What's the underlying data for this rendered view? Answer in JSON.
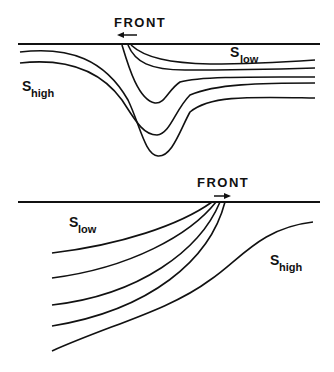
{
  "diagram": {
    "type": "schematic cross-section of salinity fronts",
    "panels": [
      {
        "id": "top",
        "front_label": "FRONT",
        "front_arrow_direction": "left",
        "labels": {
          "low": {
            "base": "S",
            "sub": "low"
          },
          "high": {
            "base": "S",
            "sub": "high"
          }
        },
        "isoline_count": 5
      },
      {
        "id": "bottom",
        "front_label": "FRONT",
        "front_arrow_direction": "right",
        "labels": {
          "low": {
            "base": "S",
            "sub": "low"
          },
          "high": {
            "base": "S",
            "sub": "high"
          }
        },
        "isoline_count": 5
      }
    ],
    "colors": {
      "ink": "#111111",
      "background": "#ffffff"
    }
  }
}
